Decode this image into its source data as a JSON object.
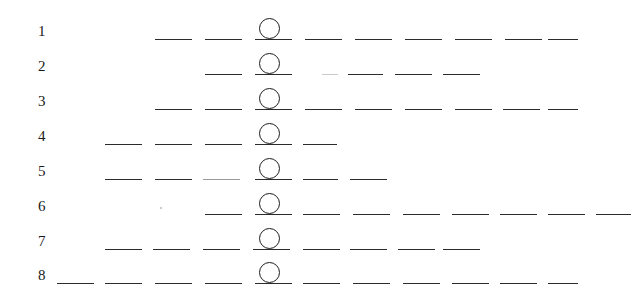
{
  "figure": {
    "width": 640,
    "height": 305,
    "background": "#ffffff",
    "ink_color": "#2b2b2b",
    "marker_color": "#1c1c1c",
    "label_color": "#1a1a1a"
  },
  "marker": {
    "shape": "circle-outline",
    "diameter": 21,
    "center_x": 269,
    "offset_above_baseline": 21
  },
  "rows": [
    {
      "label": "1",
      "baseline_y": 39,
      "label_x": 38,
      "marker_x": 269,
      "dashes": [
        {
          "x": 155,
          "w": 37,
          "tone": "normal"
        },
        {
          "x": 205,
          "w": 37,
          "tone": "normal"
        },
        {
          "x": 255,
          "w": 37,
          "tone": "normal"
        },
        {
          "x": 305,
          "w": 37,
          "tone": "normal"
        },
        {
          "x": 355,
          "w": 37,
          "tone": "normal"
        },
        {
          "x": 405,
          "w": 37,
          "tone": "normal"
        },
        {
          "x": 455,
          "w": 37,
          "tone": "normal"
        },
        {
          "x": 505,
          "w": 37,
          "tone": "normal"
        },
        {
          "x": 548,
          "w": 30,
          "tone": "normal"
        }
      ]
    },
    {
      "label": "2",
      "baseline_y": 74,
      "label_x": 38,
      "marker_x": 269,
      "dashes": [
        {
          "x": 205,
          "w": 37,
          "tone": "normal"
        },
        {
          "x": 255,
          "w": 37,
          "tone": "normal"
        },
        {
          "x": 322,
          "w": 16,
          "tone": "vfaint"
        },
        {
          "x": 348,
          "w": 35,
          "tone": "normal"
        },
        {
          "x": 395,
          "w": 37,
          "tone": "normal"
        },
        {
          "x": 443,
          "w": 37,
          "tone": "normal"
        }
      ]
    },
    {
      "label": "3",
      "baseline_y": 109,
      "label_x": 38,
      "marker_x": 269,
      "dashes": [
        {
          "x": 155,
          "w": 37,
          "tone": "normal"
        },
        {
          "x": 205,
          "w": 37,
          "tone": "normal"
        },
        {
          "x": 255,
          "w": 37,
          "tone": "normal"
        },
        {
          "x": 305,
          "w": 37,
          "tone": "normal"
        },
        {
          "x": 355,
          "w": 37,
          "tone": "normal"
        },
        {
          "x": 405,
          "w": 37,
          "tone": "normal"
        },
        {
          "x": 455,
          "w": 37,
          "tone": "normal"
        },
        {
          "x": 503,
          "w": 37,
          "tone": "normal"
        },
        {
          "x": 548,
          "w": 30,
          "tone": "normal"
        }
      ]
    },
    {
      "label": "4",
      "baseline_y": 144,
      "label_x": 38,
      "marker_x": 269,
      "dashes": [
        {
          "x": 105,
          "w": 37,
          "tone": "normal"
        },
        {
          "x": 155,
          "w": 37,
          "tone": "normal"
        },
        {
          "x": 205,
          "w": 37,
          "tone": "normal"
        },
        {
          "x": 255,
          "w": 37,
          "tone": "normal"
        },
        {
          "x": 303,
          "w": 34,
          "tone": "normal"
        }
      ]
    },
    {
      "label": "5",
      "baseline_y": 179,
      "label_x": 38,
      "marker_x": 269,
      "dashes": [
        {
          "x": 105,
          "w": 37,
          "tone": "normal"
        },
        {
          "x": 155,
          "w": 37,
          "tone": "normal"
        },
        {
          "x": 203,
          "w": 37,
          "tone": "faint"
        },
        {
          "x": 255,
          "w": 37,
          "tone": "normal"
        },
        {
          "x": 303,
          "w": 35,
          "tone": "normal"
        },
        {
          "x": 350,
          "w": 37,
          "tone": "normal"
        }
      ]
    },
    {
      "label": "6",
      "baseline_y": 214,
      "label_x": 38,
      "marker_x": 269,
      "dashes": [
        {
          "x": 205,
          "w": 37,
          "tone": "normal"
        },
        {
          "x": 255,
          "w": 37,
          "tone": "normal"
        },
        {
          "x": 303,
          "w": 37,
          "tone": "normal"
        },
        {
          "x": 353,
          "w": 37,
          "tone": "normal"
        },
        {
          "x": 403,
          "w": 37,
          "tone": "normal"
        },
        {
          "x": 452,
          "w": 37,
          "tone": "normal"
        },
        {
          "x": 500,
          "w": 37,
          "tone": "normal"
        },
        {
          "x": 548,
          "w": 37,
          "tone": "normal"
        },
        {
          "x": 596,
          "w": 35,
          "tone": "normal"
        }
      ],
      "specks": [
        {
          "x": 160,
          "y": 207,
          "d": 2
        }
      ]
    },
    {
      "label": "7",
      "baseline_y": 249,
      "label_x": 38,
      "marker_x": 269,
      "dashes": [
        {
          "x": 105,
          "w": 37,
          "tone": "normal"
        },
        {
          "x": 153,
          "w": 37,
          "tone": "normal"
        },
        {
          "x": 203,
          "w": 37,
          "tone": "normal"
        },
        {
          "x": 253,
          "w": 37,
          "tone": "normal"
        },
        {
          "x": 303,
          "w": 37,
          "tone": "normal"
        },
        {
          "x": 350,
          "w": 37,
          "tone": "normal"
        },
        {
          "x": 398,
          "w": 37,
          "tone": "normal"
        },
        {
          "x": 443,
          "w": 37,
          "tone": "normal"
        }
      ]
    },
    {
      "label": "8",
      "baseline_y": 283,
      "label_x": 38,
      "marker_x": 269,
      "dashes": [
        {
          "x": 57,
          "w": 37,
          "tone": "normal"
        },
        {
          "x": 105,
          "w": 37,
          "tone": "normal"
        },
        {
          "x": 155,
          "w": 37,
          "tone": "normal"
        },
        {
          "x": 205,
          "w": 37,
          "tone": "normal"
        },
        {
          "x": 255,
          "w": 37,
          "tone": "normal"
        },
        {
          "x": 303,
          "w": 37,
          "tone": "normal"
        },
        {
          "x": 353,
          "w": 37,
          "tone": "normal"
        },
        {
          "x": 403,
          "w": 37,
          "tone": "normal"
        },
        {
          "x": 452,
          "w": 37,
          "tone": "normal"
        },
        {
          "x": 500,
          "w": 37,
          "tone": "normal"
        },
        {
          "x": 548,
          "w": 30,
          "tone": "normal"
        }
      ]
    }
  ]
}
